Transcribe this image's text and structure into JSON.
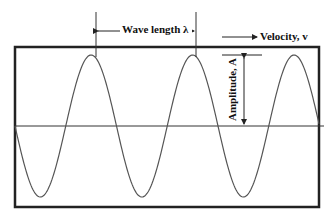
{
  "diagram": {
    "type": "sine-wave-properties",
    "labels": {
      "wavelength": "Wave length  λ",
      "velocity": "Velocity, v",
      "amplitude": "Amplitude, A"
    },
    "colors": {
      "line": "#222222",
      "wave": "#555555",
      "background": "#ffffff"
    }
  }
}
